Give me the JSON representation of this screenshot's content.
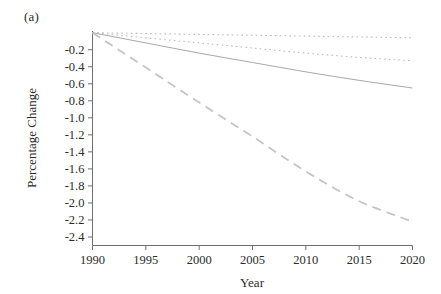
{
  "figure": {
    "panel_label": "(a)",
    "background_color": "#ffffff"
  },
  "chart_data": {
    "type": "line",
    "title": "",
    "subtitle": "",
    "xlabel": "Year",
    "ylabel": "Percentage Change",
    "xlim": [
      1990,
      2020
    ],
    "ylim": [
      -2.5,
      0.02
    ],
    "grid": false,
    "legend": "none",
    "x_ticks": [
      1990,
      1995,
      2000,
      2005,
      2010,
      2015,
      2020
    ],
    "x_tick_labels": [
      "1990",
      "1995",
      "2000",
      "2005",
      "2010",
      "2015",
      "2020"
    ],
    "y_ticks": [
      -0.2,
      -0.4,
      -0.6,
      -0.8,
      -1.0,
      -1.2,
      -1.4,
      -1.6,
      -1.8,
      -2.0,
      -2.2,
      -2.4
    ],
    "y_tick_labels": [
      "-0.2",
      "-0.4",
      "-0.6",
      "-0.8",
      "-1.0",
      "-1.2",
      "-1.4",
      "-1.6",
      "-1.8",
      "-2.0",
      "-2.2",
      "-2.4"
    ],
    "x": [
      1990,
      1995,
      2000,
      2005,
      2010,
      2015,
      2020
    ],
    "series": [
      {
        "name": "series-1",
        "style": "dotted",
        "color": "#b9b9b9",
        "width": 1.1,
        "values": [
          0.0,
          -0.01,
          -0.02,
          -0.03,
          -0.04,
          -0.05,
          -0.06
        ]
      },
      {
        "name": "series-2",
        "style": "dotted",
        "color": "#bdbdbd",
        "width": 1.1,
        "values": [
          0.0,
          -0.06,
          -0.12,
          -0.18,
          -0.24,
          -0.29,
          -0.33
        ]
      },
      {
        "name": "series-3",
        "style": "solid",
        "color": "#a8a8a8",
        "width": 1.0,
        "values": [
          0.0,
          -0.12,
          -0.24,
          -0.35,
          -0.46,
          -0.56,
          -0.65
        ]
      },
      {
        "name": "series-4",
        "style": "long-dashed",
        "color": "#c4c4c4",
        "width": 1.8,
        "values": [
          0.0,
          -0.41,
          -0.82,
          -1.22,
          -1.63,
          -1.98,
          -2.22
        ]
      }
    ]
  }
}
